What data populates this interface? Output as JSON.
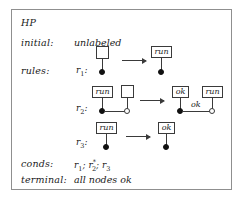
{
  "box": {
    "title": "HP",
    "border_color": "#8f8f8f",
    "background": "#ffffff"
  },
  "fields": {
    "initial_label": "initial:",
    "initial_value": "unlabeled",
    "rules_label": "rules:",
    "conds_label": "conds:",
    "conds_value": "r1; r2*; r3",
    "terminal_label": "terminal:",
    "terminal_value": "all nodes ok"
  },
  "conds_tokens": {
    "r1_name": "r",
    "r1_sub": "1",
    "sep1": ";",
    "r2_name": "r",
    "r2_sub": "2",
    "r2_sup": "*",
    "sep2": ";",
    "r3_name": "r",
    "r3_sub": "3"
  },
  "rules": [
    {
      "id": "r1",
      "name": "r",
      "subscript": "1",
      "lhs": {
        "nodes": [
          {
            "marker": "filled",
            "label": "",
            "label_kind": "empty-box"
          }
        ],
        "edges": []
      },
      "rhs": {
        "nodes": [
          {
            "marker": "filled",
            "label": "run",
            "label_kind": "text-box"
          }
        ],
        "edges": []
      },
      "arrow": "→"
    },
    {
      "id": "r2",
      "name": "r",
      "subscript": "2",
      "lhs": {
        "nodes": [
          {
            "marker": "filled",
            "label": "run",
            "label_kind": "text-box"
          },
          {
            "marker": "hollow",
            "label": "",
            "label_kind": "empty-box"
          }
        ],
        "edges": [
          {
            "from": 0,
            "to": 1,
            "label": ""
          }
        ]
      },
      "rhs": {
        "nodes": [
          {
            "marker": "filled",
            "label": "ok",
            "label_kind": "text-box"
          },
          {
            "marker": "hollow",
            "label": "run",
            "label_kind": "text-box"
          }
        ],
        "edges": [
          {
            "from": 0,
            "to": 1,
            "label": "ok"
          }
        ]
      },
      "arrow": "→"
    },
    {
      "id": "r3",
      "name": "r",
      "subscript": "3",
      "lhs": {
        "nodes": [
          {
            "marker": "filled",
            "label": "run",
            "label_kind": "text-box"
          }
        ],
        "edges": []
      },
      "rhs": {
        "nodes": [
          {
            "marker": "filled",
            "label": "ok",
            "label_kind": "text-box"
          }
        ],
        "edges": []
      },
      "arrow": "→"
    }
  ],
  "colors": {
    "ink": "#1a1a1a",
    "stroke": "#3a3a3a",
    "node_fill_dark": "#111111",
    "node_fill_light": "#ffffff"
  }
}
